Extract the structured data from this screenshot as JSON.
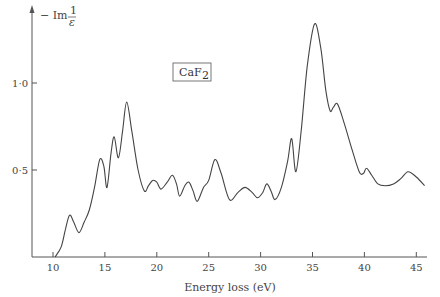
{
  "chart_data": {
    "type": "line",
    "title": "",
    "annotation": "CaF2",
    "xlabel": "Energy loss (eV)",
    "ylabel": "-Im 1/ε",
    "xlim": [
      8,
      46
    ],
    "ylim": [
      0,
      1.4
    ],
    "grid": false,
    "legend": null,
    "x_ticks": [
      10,
      15,
      20,
      25,
      30,
      35,
      40,
      45
    ],
    "x_tick_labels": [
      "10",
      "15",
      "20",
      "25",
      "30",
      "35",
      "40",
      "45"
    ],
    "y_ticks": [
      0.5,
      1.0
    ],
    "y_tick_labels": [
      "0·5",
      "1·0"
    ],
    "series": [
      {
        "name": "CaF2",
        "x": [
          10.2,
          10.8,
          11.2,
          11.6,
          12.0,
          12.5,
          13.0,
          13.5,
          14.0,
          14.5,
          14.9,
          15.2,
          15.6,
          15.9,
          16.3,
          16.7,
          17.1,
          17.6,
          18.2,
          18.8,
          19.2,
          19.6,
          20.0,
          20.4,
          21.0,
          21.5,
          21.9,
          22.2,
          22.7,
          23.1,
          23.5,
          23.9,
          24.5,
          25.0,
          25.6,
          26.2,
          27.0,
          27.8,
          28.5,
          29.2,
          29.7,
          30.2,
          30.6,
          31.0,
          31.4,
          32.0,
          32.6,
          33.0,
          33.4,
          33.9,
          34.5,
          35.2,
          35.8,
          36.3,
          36.7,
          37.0,
          37.4,
          38.0,
          38.8,
          39.5,
          39.9,
          40.2,
          40.7,
          41.3,
          42.0,
          42.8,
          43.5,
          44.2,
          45.0,
          45.8
        ],
        "values": [
          0.0,
          0.06,
          0.16,
          0.24,
          0.2,
          0.14,
          0.2,
          0.27,
          0.4,
          0.56,
          0.52,
          0.4,
          0.6,
          0.69,
          0.57,
          0.72,
          0.89,
          0.72,
          0.5,
          0.38,
          0.41,
          0.44,
          0.43,
          0.39,
          0.43,
          0.47,
          0.42,
          0.35,
          0.41,
          0.43,
          0.38,
          0.32,
          0.4,
          0.44,
          0.56,
          0.48,
          0.33,
          0.37,
          0.4,
          0.37,
          0.34,
          0.37,
          0.42,
          0.38,
          0.33,
          0.4,
          0.55,
          0.68,
          0.49,
          0.72,
          1.1,
          1.34,
          1.2,
          0.95,
          0.84,
          0.86,
          0.88,
          0.78,
          0.62,
          0.49,
          0.48,
          0.51,
          0.47,
          0.42,
          0.41,
          0.42,
          0.45,
          0.49,
          0.46,
          0.41
        ]
      }
    ]
  }
}
